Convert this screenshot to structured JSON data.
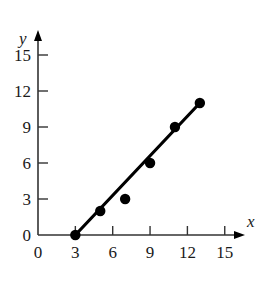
{
  "chart_data": {
    "type": "scatter",
    "title": "",
    "xlabel": "x",
    "ylabel": "y",
    "xlim": [
      0,
      17
    ],
    "ylim": [
      0,
      16
    ],
    "x_ticks": [
      0,
      3,
      6,
      9,
      12,
      15
    ],
    "y_ticks": [
      0,
      3,
      6,
      9,
      12,
      15
    ],
    "grid": false,
    "legend": null,
    "series": [
      {
        "name": "data points",
        "type": "scatter",
        "x": [
          3,
          5,
          7,
          9,
          11,
          13
        ],
        "y": [
          0,
          2,
          3,
          6,
          9,
          11
        ]
      },
      {
        "name": "fitted line",
        "type": "line",
        "x": [
          3,
          13
        ],
        "y": [
          0,
          11
        ]
      }
    ]
  },
  "colors": {
    "ink": "#000000",
    "axis": "#333333",
    "background": "#ffffff"
  }
}
